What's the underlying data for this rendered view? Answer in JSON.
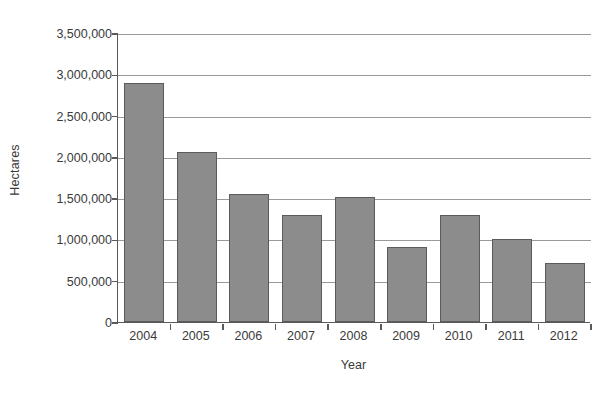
{
  "chart_data": {
    "type": "bar",
    "title": "",
    "xlabel": "Year",
    "ylabel": "Hectares",
    "categories": [
      "2004",
      "2005",
      "2006",
      "2007",
      "2008",
      "2009",
      "2010",
      "2011",
      "2012"
    ],
    "values": [
      2900000,
      2060000,
      1550000,
      1300000,
      1520000,
      910000,
      1290000,
      1000000,
      710000
    ],
    "ylim": [
      0,
      3500000
    ],
    "ytick_values": [
      0,
      500000,
      1000000,
      1500000,
      2000000,
      2500000,
      3000000,
      3500000
    ],
    "ytick_labels": [
      "0",
      "500,000",
      "1,000,000",
      "1,500,000",
      "2,000,000",
      "2,500,000",
      "3,000,000",
      "3,500,000"
    ],
    "grid": true,
    "legend": null,
    "series": [
      {
        "name": "Hectares",
        "values": [
          2900000,
          2060000,
          1550000,
          1300000,
          1520000,
          910000,
          1290000,
          1000000,
          710000
        ]
      }
    ],
    "colors": {
      "bar_fill": "#8c8c8c",
      "bar_border": "#5b5b5b",
      "gridline": "#9a9a9a",
      "axis": "#58595b",
      "text": "#3a3a3a",
      "background": "#ffffff"
    }
  }
}
